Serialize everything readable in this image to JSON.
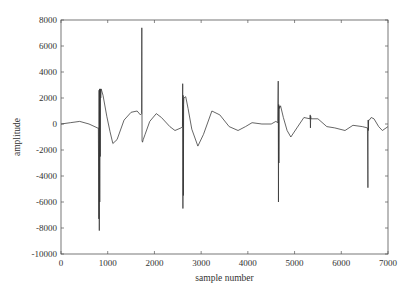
{
  "chart_data": {
    "type": "line",
    "title": "",
    "xlabel": "sample number",
    "ylabel": "amplitude",
    "xlim": [
      0,
      7000
    ],
    "ylim": [
      -10000,
      8000
    ],
    "xticks": [
      0,
      1000,
      2000,
      3000,
      4000,
      5000,
      6000,
      7000
    ],
    "yticks": [
      -10000,
      -8000,
      -6000,
      -4000,
      -2000,
      0,
      2000,
      4000,
      6000,
      8000
    ],
    "grid": false,
    "legend": "none",
    "series": [
      {
        "name": "signal",
        "color": "#333333",
        "x": [
          0,
          200,
          400,
          600,
          780,
          800,
          810,
          815,
          820,
          825,
          830,
          835,
          840,
          845,
          850,
          860,
          900,
          980,
          1050,
          1110,
          1200,
          1350,
          1500,
          1630,
          1700,
          1725,
          1730,
          1735,
          1745,
          1760,
          1800,
          1900,
          2040,
          2150,
          2330,
          2440,
          2570,
          2600,
          2605,
          2610,
          2615,
          2620,
          2625,
          2630,
          2670,
          2720,
          2800,
          2930,
          3050,
          3230,
          3400,
          3600,
          3790,
          3950,
          4090,
          4300,
          4500,
          4600,
          4640,
          4650,
          4655,
          4660,
          4665,
          4670,
          4675,
          4700,
          4760,
          4840,
          4920,
          5050,
          5200,
          5330,
          5335,
          5340,
          5345,
          5350,
          5500,
          5690,
          5860,
          6080,
          6250,
          6450,
          6560,
          6570,
          6575,
          6580,
          6585,
          6600,
          6640,
          6700,
          6800,
          6880,
          7000
        ],
        "y": [
          0,
          100,
          200,
          0,
          -300,
          -300,
          -7300,
          2600,
          -8200,
          2700,
          -6000,
          2000,
          -2500,
          2700,
          2000,
          2700,
          2200,
          600,
          -600,
          -1500,
          -1200,
          300,
          900,
          1000,
          700,
          800,
          7400,
          -1300,
          -1400,
          -1200,
          -800,
          200,
          800,
          500,
          -200,
          -500,
          -300,
          -200,
          3100,
          -6500,
          2200,
          -5500,
          1500,
          2000,
          2100,
          1200,
          -400,
          -1700,
          -800,
          1000,
          700,
          -200,
          -500,
          -200,
          100,
          0,
          0,
          200,
          100,
          3300,
          -6000,
          1500,
          -3000,
          1400,
          1200,
          1400,
          500,
          -500,
          -1000,
          -300,
          500,
          400,
          700,
          -300,
          600,
          400,
          400,
          -200,
          -300,
          -500,
          -100,
          -200,
          -300,
          -4900,
          300,
          -500,
          300,
          300,
          500,
          400,
          -200,
          -500,
          -200
        ]
      }
    ]
  }
}
